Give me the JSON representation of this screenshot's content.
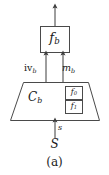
{
  "figure": {
    "caption": "(a)",
    "stroke_color": "#4a4a4a",
    "text_color": "#1a1a1a",
    "background_color": "#ffffff",
    "nodes": {
      "function_block": {
        "label_base": "f",
        "label_sub": "b",
        "shape": "rectangle"
      },
      "component_block": {
        "label_base": "C",
        "label_sub": "b",
        "shape": "trapezoid"
      },
      "inner_boxes": [
        {
          "label_base": "f",
          "label_sub": "0",
          "shape": "rectangle"
        },
        {
          "label_base": "f",
          "label_sub": "1",
          "shape": "rectangle"
        }
      ],
      "source": {
        "label": "S",
        "shape": "text"
      }
    },
    "edges": [
      {
        "label_base": "iv",
        "label_sub": "b",
        "from": "component_block",
        "to": "function_block",
        "direction": "up"
      },
      {
        "label_base": "m",
        "label_sub": "b",
        "from": "component_block",
        "to": "function_block",
        "direction": "up"
      },
      {
        "label_base": "s",
        "label_sub": "",
        "from": "source",
        "to": "component_block",
        "direction": "up"
      },
      {
        "label_base": "",
        "label_sub": "",
        "from": "function_block",
        "to": "output",
        "direction": "up"
      }
    ]
  }
}
